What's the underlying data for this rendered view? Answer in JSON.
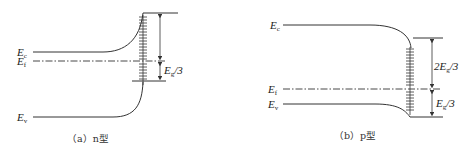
{
  "panels": [
    {
      "id": "a",
      "caption": "（a）n型",
      "labels": {
        "ec": "E",
        "ec_sub": "c",
        "ef": "E",
        "ef_sub": "f",
        "ev": "E",
        "ev_sub": "v",
        "gap_label_main": "E",
        "gap_label_sub": "g",
        "gap_label_tail": "/3"
      }
    },
    {
      "id": "b",
      "caption": "（b）p型",
      "labels": {
        "ec": "E",
        "ec_sub": "c",
        "ef": "E",
        "ef_sub": "f",
        "ev": "E",
        "ev_sub": "v",
        "gap_upper_prefix": "2E",
        "gap_upper_sub": "g",
        "gap_upper_tail": "/3",
        "gap_lower_main": "E",
        "gap_lower_sub": "g",
        "gap_lower_tail": "/3"
      }
    }
  ],
  "colors": {
    "line": "#333333",
    "text": "#222222"
  }
}
